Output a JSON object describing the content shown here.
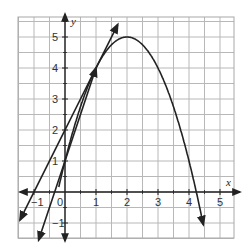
{
  "chart_data": {
    "type": "line",
    "title": "",
    "xlabel": "x",
    "ylabel": "y",
    "xlim": [
      -1.5,
      5.5
    ],
    "ylim": [
      -1.5,
      5.5
    ],
    "grid": true,
    "grid_step": 0.5,
    "x_ticks": [
      "-1",
      "0",
      "1",
      "2",
      "3",
      "4",
      "5"
    ],
    "y_ticks": [
      "-1",
      "1",
      "2",
      "3",
      "4",
      "5"
    ],
    "origin_label": "0",
    "series": [
      {
        "name": "parabola",
        "equation": "y = -(x-2)^2 + 5",
        "vertex": [
          2,
          5
        ],
        "x": [
          -0.2,
          0,
          0.5,
          1,
          1.5,
          2,
          2.5,
          3,
          3.5,
          4,
          4.24,
          4.45
        ],
        "y": [
          0.16,
          1,
          2.75,
          4,
          4.75,
          5,
          4.75,
          4,
          2.75,
          1,
          0,
          -1.0
        ]
      },
      {
        "name": "tangent line",
        "equation": "y = 2x + 2",
        "x": [
          -1.45,
          1.7
        ],
        "y": [
          -0.9,
          5.4
        ]
      },
      {
        "name": "secant line",
        "equation": "y = 3x + 1",
        "x": [
          -0.85,
          1.0
        ],
        "y": [
          -1.55,
          4.0
        ]
      }
    ],
    "legend": []
  }
}
